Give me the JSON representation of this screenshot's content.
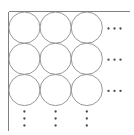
{
  "figure": {
    "canvas": {
      "width": 134,
      "height": 135,
      "background": "#ffffff"
    }
  },
  "colors": {
    "axis": "#808080",
    "circle_stroke": "#8c8c8c",
    "dot": "#4a4a4a",
    "background": "#ffffff"
  },
  "axes": {
    "top_line": {
      "x1": 8.5,
      "y1": 11.5,
      "x2": 130,
      "y2": 11.5,
      "label": "top-boundary"
    },
    "left_line": {
      "x1": 8.5,
      "y1": 11.5,
      "x2": 8.5,
      "y2": 131,
      "label": "left-boundary"
    }
  },
  "grid": {
    "rows": 3,
    "cols": 3,
    "radius": 15.6,
    "spacing": 31.2,
    "first_center_x": 24.4,
    "first_center_y": 27.6
  },
  "chart_data": {
    "type": "scatter",
    "xlabel": "",
    "ylabel": "",
    "grid": false,
    "legend": null,
    "circles": [
      {
        "row": 1,
        "col": 1,
        "cx": 24.4,
        "cy": 27.6,
        "r": 15.6
      },
      {
        "row": 1,
        "col": 2,
        "cx": 55.6,
        "cy": 27.6,
        "r": 15.6
      },
      {
        "row": 1,
        "col": 3,
        "cx": 86.8,
        "cy": 27.6,
        "r": 15.6
      },
      {
        "row": 2,
        "col": 1,
        "cx": 24.4,
        "cy": 58.8,
        "r": 15.6
      },
      {
        "row": 2,
        "col": 2,
        "cx": 55.6,
        "cy": 58.8,
        "r": 15.6
      },
      {
        "row": 2,
        "col": 3,
        "cx": 86.8,
        "cy": 58.8,
        "r": 15.6
      },
      {
        "row": 3,
        "col": 1,
        "cx": 24.4,
        "cy": 90.0,
        "r": 15.6
      },
      {
        "row": 3,
        "col": 2,
        "cx": 55.6,
        "cy": 90.0,
        "r": 15.6
      },
      {
        "row": 3,
        "col": 3,
        "cx": 86.8,
        "cy": 90.0,
        "r": 15.6
      }
    ],
    "horizontal_ellipses": [
      {
        "row": 1,
        "cy": 28.5,
        "dots_x": [
          108.5,
          114.5,
          120.5
        ]
      },
      {
        "row": 2,
        "cy": 59.7,
        "dots_x": [
          108.5,
          114.5,
          120.5
        ]
      },
      {
        "row": 3,
        "cy": 90.9,
        "dots_x": [
          108.5,
          114.5,
          120.5
        ]
      }
    ],
    "vertical_ellipses": [
      {
        "col": 1,
        "cx": 24.4,
        "dots_y": [
          111.5,
          118.5,
          125.5
        ]
      },
      {
        "col": 2,
        "cx": 55.6,
        "dots_y": [
          111.5,
          118.5,
          125.5
        ]
      },
      {
        "col": 3,
        "cx": 86.8,
        "dots_y": [
          111.5,
          118.5,
          125.5
        ]
      }
    ],
    "dot_radius": 1.15
  }
}
